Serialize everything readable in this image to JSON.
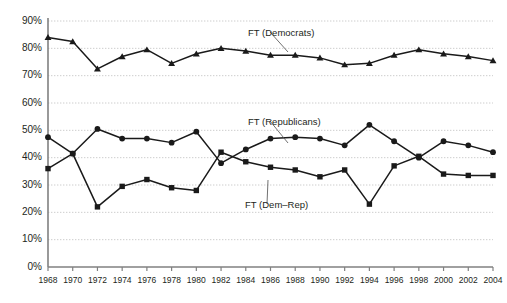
{
  "chart_data": {
    "type": "line",
    "title": "",
    "xlabel": "",
    "ylabel": "",
    "grid": true,
    "legend_position": "inline-annotations",
    "xlim": [
      1968,
      2004
    ],
    "ylim": [
      0,
      90
    ],
    "x": [
      1968,
      1970,
      1972,
      1974,
      1976,
      1978,
      1980,
      1982,
      1984,
      1986,
      1988,
      1990,
      1992,
      1994,
      1996,
      1998,
      2000,
      2002,
      2004
    ],
    "xtick_labels": [
      "1968",
      "1970",
      "1972",
      "1974",
      "1976",
      "1978",
      "1980",
      "1982",
      "1984",
      "1986",
      "1988",
      "1990",
      "1992",
      "1994",
      "1996",
      "1998",
      "2000",
      "2002",
      "2004"
    ],
    "ytick_labels": [
      "0%",
      "10%",
      "20%",
      "30%",
      "40%",
      "50%",
      "60%",
      "70%",
      "80%",
      "90%"
    ],
    "ytick_values": [
      0,
      10,
      20,
      30,
      40,
      50,
      60,
      70,
      80,
      90
    ],
    "series": [
      {
        "name": "FT (Democrats)",
        "marker": "triangle",
        "label_text": "FT (Democrats)",
        "values": [
          84,
          82.5,
          72.5,
          77,
          79.5,
          74.5,
          78,
          80,
          79,
          77.5,
          77.5,
          76.5,
          74,
          74.5,
          77.5,
          79.5,
          78,
          77,
          75.5
        ]
      },
      {
        "name": "FT (Republicans)",
        "marker": "circle",
        "label_text": "FT (Republicans)",
        "values": [
          47.5,
          41.5,
          50.5,
          47,
          47,
          45.5,
          49.5,
          38,
          43,
          47,
          47.5,
          47,
          44.5,
          52,
          46,
          40,
          46,
          44.5,
          42
        ]
      },
      {
        "name": "FT (Dem-Rep)",
        "marker": "square",
        "label_text": "FT (Dem–Rep)",
        "values": [
          36,
          41.5,
          22,
          29.5,
          32,
          29,
          28,
          42,
          38.5,
          36.5,
          35.5,
          33,
          35.5,
          23,
          37,
          40.5,
          34,
          33.5,
          33.5
        ]
      }
    ],
    "annotations": [
      {
        "text": "FT (Democrats)",
        "x_px": 248,
        "y_px": 27,
        "leader_to_x_px": 288,
        "leader_to_y_px": 52
      },
      {
        "text": "FT (Republicans)",
        "x_px": 248,
        "y_px": 116,
        "leader_to_x_px": 288,
        "leader_to_y_px": 143
      },
      {
        "text": "FT (Dem–Rep)",
        "x_px": 245,
        "y_px": 199,
        "leader_to_x_px": 268,
        "leader_to_y_px": 180
      }
    ],
    "colors": {
      "line": "#1a1a1a",
      "marker": "#1a1a1a",
      "grid": "#b7b7b7",
      "axis": "#808080",
      "text": "#231f20",
      "background": "#ffffff"
    }
  }
}
